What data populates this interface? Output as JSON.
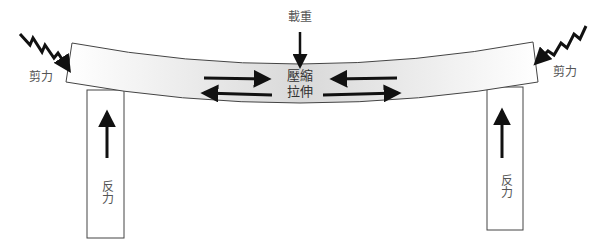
{
  "diagram": {
    "colors": {
      "stroke": "#444444",
      "arrow": "#111111",
      "beam_end": "#ffffff",
      "beam_center": "#d9d9d9",
      "support_fill": "#ffffff",
      "label": "#555555"
    },
    "labels": {
      "load": "載重",
      "shear_left": "剪力",
      "shear_right": "剪力",
      "compression": "壓縮",
      "tension": "拉伸",
      "reaction_left": "反力",
      "reaction_right": "反力"
    },
    "beam": {
      "top_left": [
        72,
        43
      ],
      "top_center": [
        300,
        64
      ],
      "top_right": [
        533,
        42
      ],
      "bottom_left": [
        66,
        82
      ],
      "bottom_center": [
        300,
        103
      ],
      "bottom_right": [
        538,
        82
      ]
    },
    "supports": [
      {
        "id": "left",
        "x": 87,
        "y": 90,
        "w": 37,
        "h": 148,
        "arrow_x": 107,
        "arrow_head_y": 113,
        "arrow_tail_y": 158
      },
      {
        "id": "right",
        "x": 487,
        "y": 87,
        "w": 36,
        "h": 143,
        "arrow_x": 502,
        "arrow_head_y": 111,
        "arrow_tail_y": 158
      }
    ],
    "load_arrow": {
      "x": 300,
      "tail_y": 32,
      "head_y": 66
    },
    "internal_arrows": [
      {
        "id": "compression-left",
        "from": [
          204,
          78
        ],
        "to": [
          268,
          79
        ]
      },
      {
        "id": "tension-left",
        "from": [
          272,
          95
        ],
        "to": [
          204,
          93
        ]
      },
      {
        "id": "compression-right",
        "from": [
          397,
          78
        ],
        "to": [
          333,
          79
        ]
      },
      {
        "id": "tension-right",
        "from": [
          323,
          95
        ],
        "to": [
          398,
          93
        ]
      }
    ],
    "shear_zigzags": [
      {
        "id": "left",
        "points": [
          [
            20,
            34
          ],
          [
            30,
            45
          ],
          [
            33,
            38
          ],
          [
            42,
            52
          ],
          [
            45,
            45
          ],
          [
            54,
            58
          ],
          [
            58,
            53
          ],
          [
            69,
            70
          ]
        ]
      },
      {
        "id": "right",
        "points": [
          [
            586,
            26
          ],
          [
            580,
            39
          ],
          [
            574,
            34
          ],
          [
            567,
            48
          ],
          [
            561,
            43
          ],
          [
            554,
            55
          ],
          [
            548,
            51
          ],
          [
            536,
            63
          ]
        ]
      }
    ],
    "label_positions": {
      "load": [
        300,
        17
      ],
      "shear_left": [
        41,
        77
      ],
      "shear_right": [
        565,
        72
      ],
      "center_text": [
        300,
        84
      ],
      "reaction_left": [
        106,
        192
      ],
      "reaction_right": [
        505,
        186
      ]
    }
  }
}
